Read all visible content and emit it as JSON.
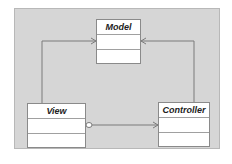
{
  "diagram": {
    "title": "",
    "classes": [
      {
        "id": "model",
        "name": "Model"
      },
      {
        "id": "view",
        "name": "View"
      },
      {
        "id": "controller",
        "name": "Controller"
      }
    ],
    "relations": [
      {
        "from": "View",
        "to": "Model",
        "type": "association-arrow"
      },
      {
        "from": "Controller",
        "to": "Model",
        "type": "association-arrow"
      },
      {
        "from": "View",
        "to": "Controller",
        "type": "aggregation-arrow"
      }
    ],
    "colors": {
      "background": "#d6d6d6",
      "box_fill": "#ffffff",
      "line": "#7a7a7a"
    }
  }
}
